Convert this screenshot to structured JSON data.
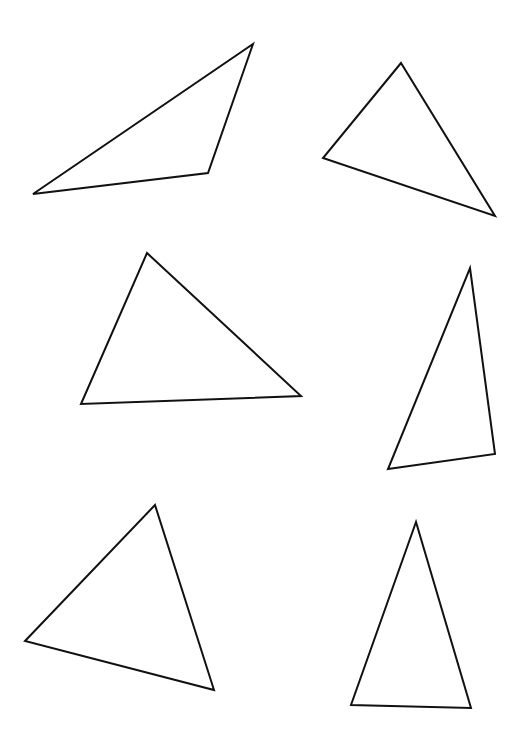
{
  "canvas": {
    "width": 528,
    "height": 743,
    "background": "#ffffff",
    "stroke_color": "#111111",
    "stroke_width": 2
  },
  "triangles": [
    {
      "id": "triangle-1",
      "points": [
        [
          253,
          44
        ],
        [
          208,
          173
        ],
        [
          33,
          194
        ]
      ]
    },
    {
      "id": "triangle-2",
      "points": [
        [
          401,
          63
        ],
        [
          323,
          158
        ],
        [
          495,
          216
        ]
      ]
    },
    {
      "id": "triangle-3",
      "points": [
        [
          147,
          253
        ],
        [
          301,
          396
        ],
        [
          81,
          404
        ]
      ]
    },
    {
      "id": "triangle-4",
      "points": [
        [
          470,
          268
        ],
        [
          495,
          454
        ],
        [
          388,
          469
        ]
      ]
    },
    {
      "id": "triangle-5",
      "points": [
        [
          155,
          505
        ],
        [
          25,
          641
        ],
        [
          214,
          690
        ]
      ]
    },
    {
      "id": "triangle-6",
      "points": [
        [
          416,
          522
        ],
        [
          351,
          705
        ],
        [
          471,
          708
        ]
      ]
    }
  ]
}
